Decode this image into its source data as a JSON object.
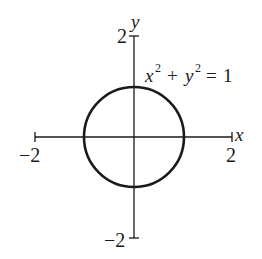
{
  "diagram": {
    "type": "circle-on-axes",
    "equation": {
      "x": "x",
      "x_exp": "2",
      "plus": "+",
      "y": "y",
      "y_exp": "2",
      "eq": "=",
      "rhs": "1"
    },
    "axes": {
      "x_label": "x",
      "y_label": "y",
      "x_min_label": "−2",
      "x_max_label": "2",
      "y_min_label": "−2",
      "y_max_label": "2",
      "x_range": [
        -2,
        2
      ],
      "y_range": [
        -2,
        2
      ]
    },
    "circle": {
      "center": [
        0,
        0
      ],
      "radius": 1
    },
    "colors": {
      "stroke": "#1a1a1a",
      "background": "#ffffff"
    }
  }
}
